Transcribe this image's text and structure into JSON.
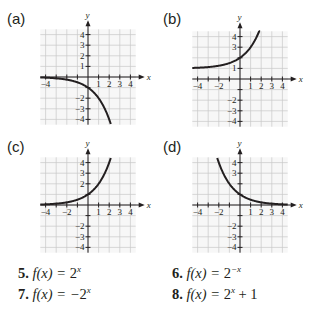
{
  "chart_data": [
    {
      "type": "line",
      "panel": "(a)",
      "xlabel": "x",
      "ylabel": "y",
      "xlim": [
        -4.5,
        4.5
      ],
      "ylim": [
        -4.5,
        4.5
      ],
      "grid": true,
      "xticks": [
        "-4",
        "1",
        "2",
        "3",
        "4"
      ],
      "yticks": [
        "4",
        "3",
        "2",
        "1",
        "-2",
        "-3",
        "-4"
      ],
      "function": "-2^x",
      "x_domain": [
        -4.5,
        2.15
      ]
    },
    {
      "type": "line",
      "panel": "(b)",
      "xlabel": "x",
      "ylabel": "y",
      "xlim": [
        -4.5,
        4.5
      ],
      "ylim": [
        -4.5,
        4.5
      ],
      "grid": true,
      "xticks": [
        "-4",
        "-2",
        "1",
        "2",
        "3",
        "4"
      ],
      "yticks": [
        "4",
        "3",
        "1",
        "-2",
        "-3",
        "-4"
      ],
      "function": "2^x+1",
      "x_domain": [
        -4.5,
        1.9
      ]
    },
    {
      "type": "line",
      "panel": "(c)",
      "xlabel": "x",
      "ylabel": "y",
      "xlim": [
        -4.5,
        4.5
      ],
      "ylim": [
        -4.5,
        4.5
      ],
      "grid": true,
      "xticks": [
        "-4",
        "-2",
        "1",
        "2",
        "3",
        "4"
      ],
      "yticks": [
        "4",
        "3",
        "2",
        "-2",
        "-3",
        "-4"
      ],
      "function": "2^x",
      "x_domain": [
        -4.5,
        2.15
      ]
    },
    {
      "type": "line",
      "panel": "(d)",
      "xlabel": "x",
      "ylabel": "y",
      "xlim": [
        -4.5,
        4.5
      ],
      "ylim": [
        -4.5,
        4.5
      ],
      "grid": true,
      "xticks": [
        "-4",
        "-2",
        "1",
        "2",
        "3",
        "4"
      ],
      "yticks": [
        "4",
        "3",
        "-2",
        "-3",
        "-4"
      ],
      "function": "2^-x",
      "x_domain": [
        -2.15,
        4.5
      ]
    }
  ],
  "panels": [
    "(a)",
    "(b)",
    "(c)",
    "(d)"
  ],
  "equations": [
    {
      "num": "5.",
      "lhs": "f(x) = ",
      "base": "2",
      "exp": "x",
      "tail": ""
    },
    {
      "num": "6.",
      "lhs": "f(x) = ",
      "base": "2",
      "exp": "−x",
      "tail": ""
    },
    {
      "num": "7.",
      "lhs": "f(x) = −",
      "base": "2",
      "exp": "x",
      "tail": ""
    },
    {
      "num": "8.",
      "lhs": "f(x) = ",
      "base": "2",
      "exp": "x",
      "tail": " + 1"
    }
  ]
}
